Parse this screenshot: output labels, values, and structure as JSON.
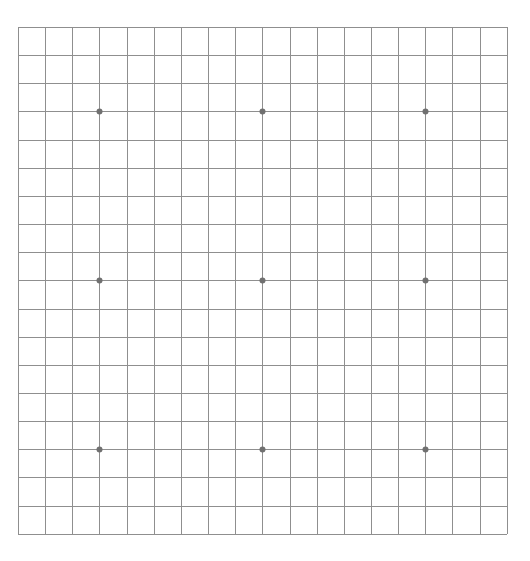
{
  "board": {
    "type": "go-board",
    "size": 19,
    "origin_x": 18,
    "origin_y": 27,
    "spacing_x": 27.15,
    "spacing_y": 28.15,
    "line_color": "#8f8f8f",
    "background_color": "#ffffff",
    "star_points": [
      {
        "col": 3,
        "row": 3
      },
      {
        "col": 9,
        "row": 3
      },
      {
        "col": 15,
        "row": 3
      },
      {
        "col": 3,
        "row": 9
      },
      {
        "col": 9,
        "row": 9
      },
      {
        "col": 15,
        "row": 9
      },
      {
        "col": 3,
        "row": 15
      },
      {
        "col": 9,
        "row": 15
      },
      {
        "col": 15,
        "row": 15
      }
    ],
    "star_point_color": "#707070",
    "stones": []
  }
}
